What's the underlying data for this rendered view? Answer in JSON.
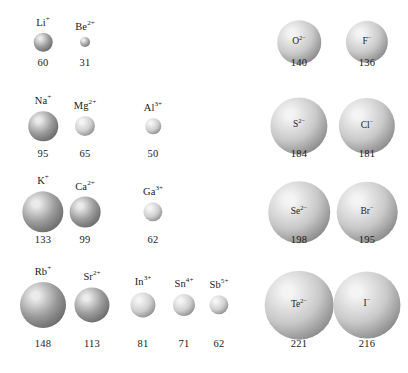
{
  "figure": {
    "units": "pm",
    "background": "#ffffff",
    "cation_color": "#9a9a9a",
    "cation_light_color": "#cfcfcf",
    "anion_color": "#c9c9c9",
    "text_color": "#1a1a1a"
  },
  "chart_data": {
    "type": "scatter",
    "xlabel": "",
    "ylabel": "",
    "value_unit": "pm",
    "encoding": "circle area/diameter proportional to ionic radius",
    "groups": [
      {
        "name": "cations",
        "label_position": "above-sphere",
        "fill": "#9a9a9a",
        "rows": [
          {
            "row": 1,
            "items": [
              {
                "ion": "Li",
                "charge": "+",
                "label": "Li",
                "sup": "+",
                "radius": 60,
                "value_text": "60"
              },
              {
                "ion": "Be",
                "charge": "2+",
                "label": "Be",
                "sup": "2+",
                "radius": 31,
                "value_text": "31"
              }
            ]
          },
          {
            "row": 2,
            "items": [
              {
                "ion": "Na",
                "charge": "+",
                "label": "Na",
                "sup": "+",
                "radius": 95,
                "value_text": "95"
              },
              {
                "ion": "Mg",
                "charge": "2+",
                "label": "Mg",
                "sup": "2+",
                "radius": 65,
                "value_text": "65"
              },
              {
                "ion": "Al",
                "charge": "3+",
                "label": "Al",
                "sup": "3+",
                "radius": 50,
                "value_text": "50"
              }
            ]
          },
          {
            "row": 3,
            "items": [
              {
                "ion": "K",
                "charge": "+",
                "label": "K",
                "sup": "+",
                "radius": 133,
                "value_text": "133"
              },
              {
                "ion": "Ca",
                "charge": "2+",
                "label": "Ca",
                "sup": "2+",
                "radius": 99,
                "value_text": "99"
              },
              {
                "ion": "Ga",
                "charge": "3+",
                "label": "Ga",
                "sup": "3+",
                "radius": 62,
                "value_text": "62"
              }
            ]
          },
          {
            "row": 4,
            "items": [
              {
                "ion": "Rb",
                "charge": "+",
                "label": "Rb",
                "sup": "+",
                "radius": 148,
                "value_text": "148"
              },
              {
                "ion": "Sr",
                "charge": "2+",
                "label": "Sr",
                "sup": "2+",
                "radius": 113,
                "value_text": "113"
              },
              {
                "ion": "In",
                "charge": "3+",
                "label": "In",
                "sup": "3+",
                "radius": 81,
                "value_text": "81"
              },
              {
                "ion": "Sn",
                "charge": "4+",
                "label": "Sn",
                "sup": "4+",
                "radius": 71,
                "value_text": "71"
              },
              {
                "ion": "Sb",
                "charge": "5+",
                "label": "Sb",
                "sup": "5+",
                "radius": 62,
                "value_text": "62"
              }
            ]
          }
        ]
      },
      {
        "name": "anions",
        "label_position": "inside-sphere",
        "fill": "#c9c9c9",
        "rows": [
          {
            "row": 1,
            "items": [
              {
                "ion": "O",
                "charge": "2-",
                "label": "O",
                "sup": "2−",
                "radius": 140,
                "value_text": "140"
              },
              {
                "ion": "F",
                "charge": "-",
                "label": "F",
                "sup": "−",
                "radius": 136,
                "value_text": "136"
              }
            ]
          },
          {
            "row": 2,
            "items": [
              {
                "ion": "S",
                "charge": "2-",
                "label": "S",
                "sup": "2−",
                "radius": 184,
                "value_text": "184"
              },
              {
                "ion": "Cl",
                "charge": "-",
                "label": "Cl",
                "sup": "−",
                "radius": 181,
                "value_text": "181"
              }
            ]
          },
          {
            "row": 3,
            "items": [
              {
                "ion": "Se",
                "charge": "2-",
                "label": "Se",
                "sup": "2−",
                "radius": 198,
                "value_text": "198"
              },
              {
                "ion": "Br",
                "charge": "-",
                "label": "Br",
                "sup": "−",
                "radius": 195,
                "value_text": "195"
              }
            ]
          },
          {
            "row": 4,
            "items": [
              {
                "ion": "Te",
                "charge": "2-",
                "label": "Te",
                "sup": "2−",
                "radius": 221,
                "value_text": "221"
              },
              {
                "ion": "I",
                "charge": "-",
                "label": "I",
                "sup": "−",
                "radius": 216,
                "value_text": "216"
              }
            ]
          }
        ]
      }
    ]
  },
  "layout": {
    "cation_columns_x": [
      43,
      85,
      153,
      185,
      219
    ],
    "cation_row4_columns_x": [
      43,
      92,
      143,
      184,
      219
    ],
    "anion_columns_x": [
      299,
      367
    ],
    "row_center_y": [
      42,
      126,
      212,
      305
    ],
    "value_y": [
      58,
      149,
      235,
      339
    ]
  }
}
